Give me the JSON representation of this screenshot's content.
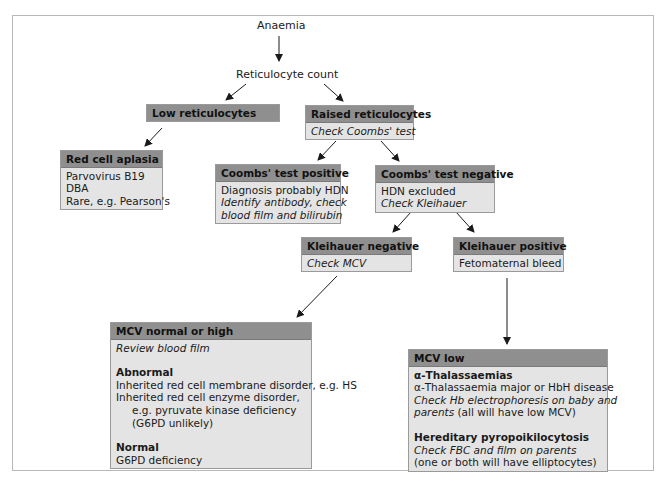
{
  "diagram": {
    "root": "Anaemia",
    "step1": "Reticulocyte count",
    "low_retic": {
      "title": "Low reticulocytes"
    },
    "raised_retic": {
      "title": "Raised reticulocytes",
      "lines": [
        "Check Coombs' test"
      ]
    },
    "red_cell_aplasia": {
      "title": "Red cell aplasia",
      "lines": [
        "Parvovirus B19",
        "DBA",
        "Rare, e.g. Pearson's"
      ]
    },
    "coombs_positive": {
      "title": "Coombs' test positive",
      "lines": [
        "Diagnosis probably HDN",
        "Identify antibody, check",
        "blood film and bilirubin"
      ]
    },
    "coombs_negative": {
      "title": "Coombs' test negative",
      "lines": [
        "HDN excluded",
        "Check Kleihauer"
      ]
    },
    "kleihauer_negative": {
      "title": "Kleihauer negative",
      "lines": [
        "Check MCV"
      ]
    },
    "kleihauer_positive": {
      "title": "Kleihauer positive",
      "lines": [
        "Fetomaternal bleed"
      ]
    },
    "mcv_normal_high": {
      "title": "MCV normal or high",
      "lines": [
        "Review blood film",
        "Abnormal",
        "Inherited red cell membrane disorder, e.g. HS",
        "Inherited red cell enzyme disorder,",
        "e.g. pyruvate kinase deficiency",
        "(G6PD unlikely)",
        "Normal",
        "G6PD deficiency"
      ]
    },
    "mcv_low": {
      "title": "MCV low",
      "lines": [
        "α-Thalassaemias",
        "α-Thalassaemia major or HbH disease",
        "Check Hb electrophoresis on baby and",
        "parents",
        " (all will have low MCV)",
        "Hereditary pyropoikilocytosis",
        "Check FBC and film on parents",
        "(one or both will have elliptocytes)"
      ]
    }
  },
  "colors": {
    "header_fill": "#8f8f8f",
    "body_fill": "#e4e4e4",
    "border": "#9a9a9a",
    "arrow": "#1a1a1a"
  }
}
